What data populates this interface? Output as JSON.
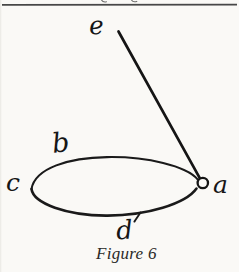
{
  "figure": {
    "caption": "Figure 6",
    "labels": {
      "a": "a",
      "b": "b",
      "c": "c",
      "d": "d",
      "e": "e"
    }
  },
  "colors": {
    "paper": "#faf9f6",
    "ink": "#1a1a1a",
    "header_rule": "#474747"
  }
}
